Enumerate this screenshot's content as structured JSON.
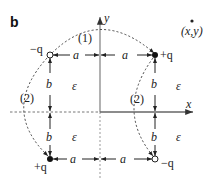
{
  "figure": {
    "panel_label": "b",
    "axes": {
      "x_label": "x",
      "y_label": "y"
    },
    "point_label": "(x,y)",
    "medium_label": "ε",
    "charges": [
      {
        "id": "top-left",
        "label": "−q",
        "sign": "negative",
        "style": "open"
      },
      {
        "id": "top-right",
        "label": "+q",
        "sign": "positive",
        "style": "filled"
      },
      {
        "id": "bottom-left",
        "label": "+q",
        "sign": "positive",
        "style": "filled"
      },
      {
        "id": "bottom-right",
        "label": "−q",
        "sign": "negative",
        "style": "open"
      }
    ],
    "distances": {
      "horizontal": "a",
      "vertical": "b"
    },
    "paths": [
      {
        "id": "path-1",
        "label": "(1)"
      },
      {
        "id": "path-2-left",
        "label": "(2)"
      },
      {
        "id": "path-2-right",
        "label": "(2)"
      }
    ],
    "colors": {
      "line": "#222222",
      "axis": "#777777",
      "dashed": "#444444"
    }
  }
}
